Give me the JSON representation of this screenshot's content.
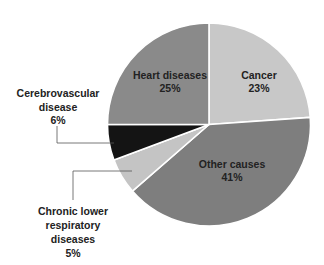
{
  "chart_data": {
    "type": "pie",
    "title": "",
    "start_angle_deg": 0,
    "direction": "clockwise",
    "slices": [
      {
        "label": "Cancer",
        "value": 23,
        "value_label": "23%",
        "color": "#c8c8c8",
        "start": 0,
        "end": 86
      },
      {
        "label": "Other causes",
        "value": 41,
        "value_label": "41%",
        "color": "#7e7e7e",
        "start": 86,
        "end": 229
      },
      {
        "label": "Chronic lower respiratory diseases",
        "value": 5,
        "value_label": "5%",
        "color": "#c4c4c4",
        "start": 229,
        "end": 249.5
      },
      {
        "label": "Cerebrovascular disease",
        "value": 6,
        "value_label": "6%",
        "color": "#141414",
        "start": 249.5,
        "end": 270
      },
      {
        "label": "Heart diseases",
        "value": 25,
        "value_label": "25%",
        "color": "#8a8a8a",
        "start": 270,
        "end": 360
      }
    ],
    "categories": [
      "Heart diseases",
      "Cancer",
      "Other causes",
      "Chronic lower respiratory diseases",
      "Cerebrovascular disease"
    ],
    "values": [
      25,
      23,
      41,
      5,
      6
    ],
    "units": "%",
    "legend": "none (labels on/near slices)"
  },
  "geometry": {
    "cx": 209,
    "cy": 124.5,
    "r": 101.5
  },
  "labels": {
    "heart": {
      "line1": "Heart diseases",
      "line2": "25%"
    },
    "cancer": {
      "line1": "Cancer",
      "line2": "23%"
    },
    "other": {
      "line1": "Other causes",
      "line2": "41%"
    },
    "cerebro": {
      "line1": "Cerebrovascular",
      "line2": "disease",
      "line3": "6%"
    },
    "chronic": {
      "line1": "Chronic lower",
      "line2": "respiratory",
      "line3": "diseases",
      "line4": "5%"
    }
  }
}
